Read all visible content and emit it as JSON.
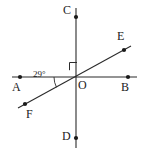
{
  "figure": {
    "canvas": {
      "width": 148,
      "height": 155,
      "background": "#ffffff"
    },
    "stroke_color": "#2b2b2b",
    "label_color": "#1a1a1a",
    "points": [
      {
        "id": "A",
        "label": "A",
        "x": 20,
        "y": 77,
        "label_x": 15,
        "label_y": 82
      },
      {
        "id": "B",
        "label": "B",
        "x": 128,
        "y": 77,
        "label_x": 123,
        "label_y": 82
      },
      {
        "id": "C",
        "label": "C",
        "x": 76,
        "y": 17,
        "label_x": 63,
        "label_y": 8
      },
      {
        "id": "D",
        "label": "D",
        "x": 76,
        "y": 138,
        "label_x": 63,
        "label_y": 133
      },
      {
        "id": "E",
        "label": "E",
        "x": 124,
        "y": 50,
        "label_x": 118,
        "label_y": 33
      },
      {
        "id": "F",
        "label": "F",
        "x": 25,
        "y": 104,
        "label_x": 26,
        "label_y": 110
      },
      {
        "id": "O",
        "label": "O",
        "x": 76,
        "y": 77,
        "label_x": 78,
        "label_y": 80
      }
    ],
    "lines": [
      {
        "id": "AB",
        "from": "A",
        "to": "B",
        "x1": 12,
        "y1": 77,
        "x2": 137,
        "y2": 77
      },
      {
        "id": "CD",
        "from": "C",
        "to": "D",
        "x1": 76,
        "y1": 8,
        "x2": 76,
        "y2": 148
      },
      {
        "id": "FE",
        "from": "F",
        "to": "E",
        "x1": 18,
        "y1": 108,
        "x2": 131,
        "y2": 46
      }
    ],
    "angles": [
      {
        "id": "AOF",
        "value": "29°",
        "vertex": "O",
        "arms": [
          "A",
          "F"
        ],
        "label_x": 34,
        "label_y": 73,
        "arc_radius": 22
      },
      {
        "id": "COE",
        "value": "right-angle",
        "vertex": "O",
        "arms": [
          "C",
          "E"
        ],
        "marker": "square"
      }
    ]
  }
}
